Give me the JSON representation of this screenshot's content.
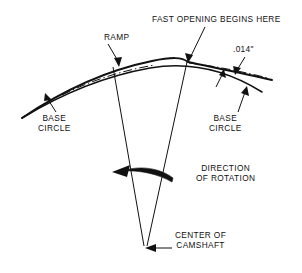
{
  "diagram": {
    "labels": {
      "fast_opening": "FAST OPENING BEGINS HERE",
      "ramp": "RAMP",
      "lift_dimension": ".014\"",
      "base_circle_left": "BASE\nCIRCLE",
      "base_circle_right": "BASE\nCIRCLE",
      "direction_of_rotation": "DIRECTION\nOF ROTATION",
      "center_of_camshaft": "CENTER OF\nCAMSHAFT"
    },
    "colors": {
      "ink": "#111111",
      "paper": "#ffffff"
    },
    "geometry": {
      "camshaft_center": {
        "x": 145,
        "y": 249
      },
      "base_circle_radius": 187,
      "ramp_start_x": 22,
      "fast_opening_point": {
        "x": 187,
        "y": 63
      },
      "lift_at_fast_opening_inches": 0.014
    }
  }
}
